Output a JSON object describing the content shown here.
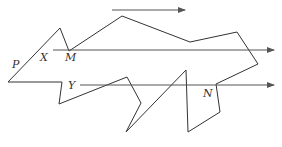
{
  "diagram": {
    "stroke_color": "#333333",
    "arrow_color": "#555555",
    "polygon_points": "8,82 60,28 69,51 122,16 190,42 237,32 258,64 216,84 220,112 188,132 186,70 126,132 141,103 127,77 59,104 62,82",
    "arrows": [
      {
        "name": "top-arrow",
        "x1": 112,
        "y1": 10,
        "x2": 185,
        "y2": 10
      },
      {
        "name": "middle-arrow",
        "x1": 53,
        "y1": 50,
        "x2": 274,
        "y2": 50
      },
      {
        "name": "lower-arrow",
        "x1": 80,
        "y1": 85,
        "x2": 274,
        "y2": 85
      }
    ],
    "labels": {
      "P": "P",
      "X": "X",
      "M": "M",
      "Y": "Y",
      "N": "N"
    }
  }
}
